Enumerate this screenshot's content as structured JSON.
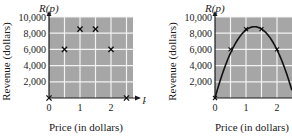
{
  "chart_data": [
    {
      "type": "scatter",
      "title": "",
      "function_label": "R(p)",
      "xlabel": "Price (in dollars)",
      "ylabel": "Revenue (dollars)",
      "x_axis_var": "p",
      "xlim": [
        0,
        2.7
      ],
      "ylim": [
        0,
        10000
      ],
      "x_ticks": [
        0,
        1,
        2
      ],
      "x_tick_labels": [
        "0",
        "1",
        "2"
      ],
      "y_ticks": [
        2000,
        4000,
        6000,
        8000,
        10000
      ],
      "y_tick_labels": [
        "2,000",
        "4,000",
        "6,000",
        "8,000",
        "10,000"
      ],
      "grid": true,
      "grid_x_step": 0.5,
      "grid_y_step": 2000,
      "marker": "x",
      "series": [
        {
          "name": "data",
          "x": [
            0,
            0.5,
            1,
            1.5,
            2,
            2.5
          ],
          "y": [
            0,
            6000,
            8500,
            8500,
            6000,
            0
          ]
        }
      ]
    },
    {
      "type": "line",
      "title": "",
      "function_label": "R(p)",
      "xlabel": "Price (in dollars)",
      "ylabel": "Revenue (dollars)",
      "xlim": [
        0,
        2.5
      ],
      "ylim": [
        0,
        10000
      ],
      "x_ticks": [
        0,
        1,
        2
      ],
      "x_tick_labels": [
        "0",
        "1",
        "2"
      ],
      "y_ticks": [
        2000,
        4000,
        6000,
        8000,
        10000
      ],
      "y_tick_labels": [
        "2,000",
        "4,000",
        "6,000",
        "8,000",
        "10,000"
      ],
      "grid": true,
      "grid_x_step": 0.5,
      "grid_y_step": 2000,
      "series": [
        {
          "name": "fitted quadratic",
          "x": [
            0,
            0.5,
            1,
            1.25,
            1.5,
            2,
            2.5
          ],
          "y": [
            0,
            6000,
            8500,
            8800,
            8500,
            6000,
            0
          ]
        },
        {
          "name": "data points",
          "x": [
            0,
            0.5,
            1,
            1.5,
            2
          ],
          "y": [
            0,
            6000,
            8500,
            8500,
            6000
          ]
        }
      ]
    }
  ],
  "colors": {
    "plot_background": "#a6a6a6",
    "grid": "#f2f2f2",
    "axis": "#1a1a1a",
    "curve": "#111111"
  }
}
